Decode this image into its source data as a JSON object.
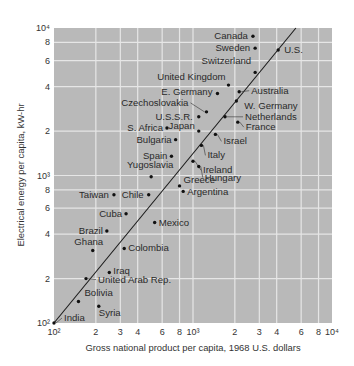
{
  "chart_data": {
    "type": "scatter",
    "title": "",
    "xlabel": "Gross national product per capita, 1968 U.S. dollars",
    "ylabel": "Electrical energy per capita, kW-hr",
    "xscale": "log",
    "yscale": "log",
    "xlim": [
      100,
      10000
    ],
    "ylim": [
      100,
      10000
    ],
    "grid": true,
    "legend": null,
    "x_ticks": [
      "10²",
      "2",
      "3",
      "4",
      "6",
      "8",
      "10³",
      "2",
      "3",
      "4",
      "6",
      "8",
      "10⁴"
    ],
    "y_ticks": [
      "10²",
      "2",
      "4",
      "6",
      "8",
      "10³",
      "2",
      "4",
      "6",
      "8",
      "10⁴"
    ],
    "trend_line": {
      "description": "proportionality line",
      "from": [
        100,
        100
      ],
      "to": [
        5500,
        10000
      ]
    },
    "points": [
      {
        "label": "Canada",
        "x": 2700,
        "y": 8800
      },
      {
        "label": "Sweden",
        "x": 2800,
        "y": 7300
      },
      {
        "label": "U.S.",
        "x": 4100,
        "y": 7100
      },
      {
        "label": "Switzerland",
        "x": 2800,
        "y": 5000
      },
      {
        "label": "United Kingdom",
        "x": 1800,
        "y": 4100
      },
      {
        "label": "E. Germany",
        "x": 1500,
        "y": 3600
      },
      {
        "label": "Australia",
        "x": 2150,
        "y": 3700
      },
      {
        "label": "W. Germany",
        "x": 2050,
        "y": 3200
      },
      {
        "label": "Czechoslovakia",
        "x": 1250,
        "y": 2700
      },
      {
        "label": "U.S.S.R.",
        "x": 1100,
        "y": 2500
      },
      {
        "label": "Netherlands",
        "x": 1700,
        "y": 2500
      },
      {
        "label": "France",
        "x": 2100,
        "y": 2300
      },
      {
        "label": "S. Africa",
        "x": 650,
        "y": 2100
      },
      {
        "label": "Japan",
        "x": 1100,
        "y": 2000
      },
      {
        "label": "Israel",
        "x": 1450,
        "y": 1900
      },
      {
        "label": "Bulgaria",
        "x": 750,
        "y": 1750
      },
      {
        "label": "Italy",
        "x": 1150,
        "y": 1600
      },
      {
        "label": "Spain",
        "x": 700,
        "y": 1350
      },
      {
        "label": "Ireland",
        "x": 1000,
        "y": 1250
      },
      {
        "label": "Hungary",
        "x": 1100,
        "y": 1150
      },
      {
        "label": "Yugoslavia",
        "x": 500,
        "y": 980
      },
      {
        "label": "Greece",
        "x": 800,
        "y": 850
      },
      {
        "label": "Argentina",
        "x": 850,
        "y": 780
      },
      {
        "label": "Taiwan",
        "x": 270,
        "y": 740
      },
      {
        "label": "Chile",
        "x": 480,
        "y": 740
      },
      {
        "label": "Cuba",
        "x": 330,
        "y": 550
      },
      {
        "label": "Mexico",
        "x": 530,
        "y": 480
      },
      {
        "label": "Brazil",
        "x": 240,
        "y": 420
      },
      {
        "label": "Colombia",
        "x": 320,
        "y": 320
      },
      {
        "label": "Ghana",
        "x": 190,
        "y": 310
      },
      {
        "label": "Iraq",
        "x": 250,
        "y": 220
      },
      {
        "label": "United Arab Rep.",
        "x": 170,
        "y": 200
      },
      {
        "label": "Bolivia",
        "x": 150,
        "y": 140
      },
      {
        "label": "Syria",
        "x": 210,
        "y": 130
      },
      {
        "label": "India",
        "x": 100,
        "y": 100
      }
    ]
  },
  "axes": {
    "x_title": "Gross national product per capita, 1968 U.S. dollars",
    "y_title": "Electrical energy per capita, kW-hr"
  },
  "colors": {
    "plot_background": "#b9b9b9",
    "grid": "#e6e6e6",
    "points": "#111111",
    "text": "#2a2a2a"
  }
}
